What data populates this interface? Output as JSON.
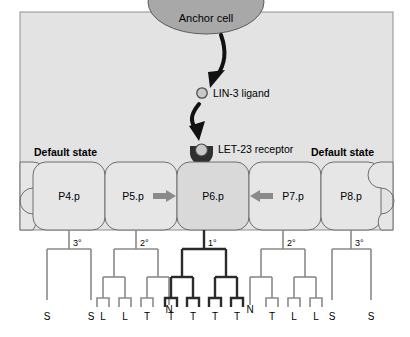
{
  "diagram": {
    "anchor_cell": {
      "label": "Anchor cell"
    },
    "ligand": {
      "label": "LIN-3 ligand",
      "icon": "open-circle-icon"
    },
    "receptor": {
      "label": "LET-23 receptor",
      "icon": "y-receptor-icon"
    },
    "default_state_left": "Default state",
    "default_state_right": "Default state",
    "lateral_arrow_left": "left-arrow-icon",
    "lateral_arrow_right": "right-arrow-icon",
    "cells": [
      {
        "name": "P4.p",
        "fate": "3°",
        "induced": false
      },
      {
        "name": "P5.p",
        "fate": "2°",
        "induced": false
      },
      {
        "name": "P6.p",
        "fate": "1°",
        "induced": true
      },
      {
        "name": "P7.p",
        "fate": "2°",
        "induced": false
      },
      {
        "name": "P8.p",
        "fate": "3°",
        "induced": false
      }
    ],
    "lineages": [
      {
        "cell": "P4.p",
        "fate": "3°",
        "leaves": [
          "S",
          "S"
        ],
        "bold": false
      },
      {
        "cell": "P5.p",
        "fate": "2°",
        "leaves": [
          "L",
          "L",
          "T",
          "N"
        ],
        "bold": false
      },
      {
        "cell": "P6.p",
        "fate": "1°",
        "leaves": [
          "T",
          "T",
          "T",
          "T"
        ],
        "bold": true
      },
      {
        "cell": "P7.p",
        "fate": "2°",
        "leaves": [
          "N",
          "T",
          "L",
          "L"
        ],
        "bold": false
      },
      {
        "cell": "P8.p",
        "fate": "3°",
        "leaves": [
          "S",
          "S"
        ],
        "bold": false
      }
    ],
    "colors": {
      "panel_bg": "#e3e3e3",
      "cell_fill": "#e6e6e6",
      "induced_cell_fill": "#d9d9d9",
      "anchor_fill": "#a8a8a8",
      "ligand_fill": "#c9c9c9",
      "line": "#7a7a7a",
      "bold_line": "#2b2b2b",
      "text": "#000000",
      "arrow_gray": "#8a8a8a"
    }
  }
}
